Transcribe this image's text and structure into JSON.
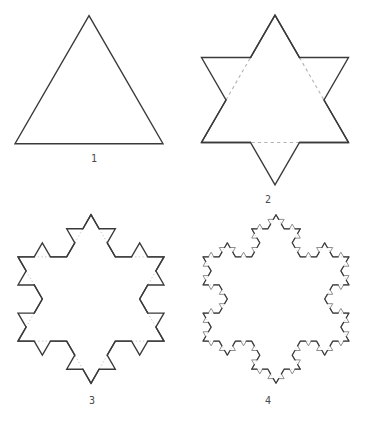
{
  "diagram": {
    "type": "koch-snowflake-construction",
    "background": "#ffffff",
    "figures": [
      {
        "label": "1",
        "iteration": 0,
        "cx": 89,
        "cy": 101,
        "side": 148,
        "stroke": "#3a3a3a",
        "stroke_width": 1.4,
        "bump_stroke": "#3a3a3a",
        "bump_width": 1.4,
        "removed": "none",
        "removed_stroke": "",
        "removed_width": 0,
        "removed_dash": "",
        "label_x": 94,
        "label_y": 162
      },
      {
        "label": "2",
        "iteration": 1,
        "cx": 275,
        "cy": 100,
        "side": 147,
        "stroke": "#3a3a3a",
        "stroke_width": 1.4,
        "bump_stroke": "#3a3a3a",
        "bump_width": 1.4,
        "removed": "dashed",
        "removed_stroke": "#b2b2b2",
        "removed_width": 1.1,
        "removed_dash": "3.2,3.2",
        "label_x": 268,
        "label_y": 203
      },
      {
        "label": "3",
        "iteration": 2,
        "cx": 91,
        "cy": 299,
        "side": 146,
        "stroke": "#3a3a3a",
        "stroke_width": 1.35,
        "bump_stroke": "#3a3a3a",
        "bump_width": 1.35,
        "removed": "dotted",
        "removed_stroke": "#c3c3c3",
        "removed_width": 1,
        "removed_dash": "1.3,2.3",
        "label_x": 92,
        "label_y": 404
      },
      {
        "label": "4",
        "iteration": 3,
        "cx": 276,
        "cy": 299,
        "side": 146,
        "stroke": "#3c3c3c",
        "stroke_width": 1.25,
        "bump_stroke": "#8f8f8f",
        "bump_width": 1,
        "removed": "dotted",
        "removed_stroke": "#c8c8c8",
        "removed_width": 0.9,
        "removed_dash": "1,1.8",
        "label_x": 268,
        "label_y": 404
      }
    ]
  }
}
